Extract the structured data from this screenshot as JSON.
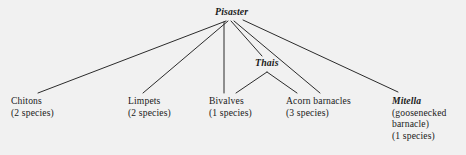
{
  "diagram": {
    "background_color": "#f1f1f1",
    "line_color": "#2b2b2b",
    "text_color": "#1a1a1a",
    "root": {
      "label": "Pisaster",
      "italic": true
    },
    "intermediate": {
      "label": "Thais",
      "italic": true
    },
    "prey": [
      {
        "name": "Chitons",
        "count": "(2 species)",
        "italic_name": false,
        "extra_lines": []
      },
      {
        "name": "Limpets",
        "count": "(2 species)",
        "italic_name": false,
        "extra_lines": []
      },
      {
        "name": "Bivalves",
        "count": "(1 species)",
        "italic_name": false,
        "extra_lines": []
      },
      {
        "name": "Acorn barnacles",
        "count": "(3 species)",
        "italic_name": false,
        "extra_lines": []
      },
      {
        "name": "Mitella",
        "count": "(1 species)",
        "italic_name": true,
        "extra_lines": [
          "(goosenecked",
          "barnacle)"
        ]
      }
    ]
  }
}
